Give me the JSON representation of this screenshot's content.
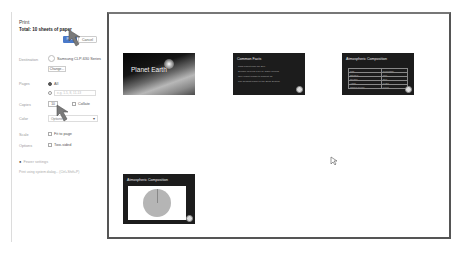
{
  "print_panel": {
    "title": "Print",
    "total": "Total: 10 sheets of paper",
    "print_button": "Print",
    "cancel_button": "Cancel",
    "destination_label": "Destination",
    "destination_value": "Samsung CLP-630 Series",
    "change_button": "Change...",
    "pages_label": "Pages",
    "pages_all": "All",
    "pages_range_placeholder": "e.g. 1-5, 8, 11-13",
    "copies_label": "Copies",
    "copies_value": "10",
    "collate_label": "Collate",
    "color_label": "Color",
    "color_value": "Options",
    "scale_label": "Scale",
    "fit_to_page": "Fit to page",
    "options_label": "Options",
    "two_sided": "Two-sided",
    "more_settings": "Fewer settings",
    "system_dialog_link": "Print using system dialog... (Ctrl+Shift+P)"
  },
  "preview": {
    "slides": [
      {
        "title": "Planet Earth"
      },
      {
        "title": "Common Facts",
        "bullets": [
          "Third planet from the Sun",
          "Surface covered 71% by water oceans",
          "Only planet known to support life",
          "The densest planet in the Solar System"
        ]
      },
      {
        "title": "Atmospheric Composition",
        "table": [
          [
            "Gas",
            "Percentage"
          ],
          [
            "Nitrogen",
            "78%"
          ],
          [
            "Oxygen",
            "21%"
          ],
          [
            "Argon",
            "0.93%"
          ],
          [
            "Carbon dioxide",
            "0.04%"
          ],
          [
            "Other",
            "0.03%"
          ]
        ]
      },
      {
        "title": "Atmospheric Composition",
        "has_pie_chart": true
      }
    ]
  },
  "colors": {
    "accent": "#4a79c9",
    "preview_border": "#555555"
  }
}
